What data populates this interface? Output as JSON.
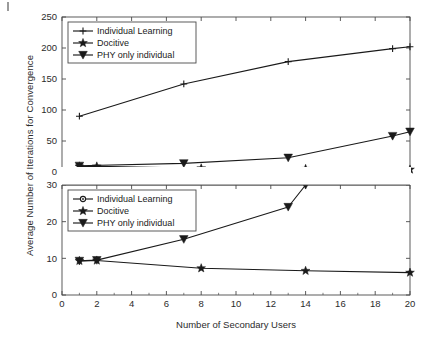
{
  "figure": {
    "background_color": "#ffffff",
    "line_color": "#1a1a1a",
    "axis_color": "#4a4a4a",
    "artifact_name": "scan-mark"
  },
  "axis_labels": {
    "xlabel": "Number of Secondary Users",
    "ylabel": "Average Number of Iterations for Convergence"
  },
  "chart_data": [
    {
      "type": "line",
      "id": "top-panel",
      "title": "",
      "xlabel": "",
      "ylabel": "Average Number of Iterations for Convergence",
      "xlim": [
        0,
        20
      ],
      "ylim": [
        0,
        250
      ],
      "xticks": [
        0,
        2,
        4,
        6,
        8,
        10,
        12,
        14,
        16,
        18,
        20
      ],
      "yticks": [
        0,
        50,
        100,
        150,
        200,
        250
      ],
      "xticklabels": [
        "0",
        "2",
        "4",
        "6",
        "8",
        "10",
        "12",
        "14",
        "16",
        "18",
        "20"
      ],
      "yticklabels": [
        "0",
        "50",
        "100",
        "150",
        "200",
        "250"
      ],
      "grid": false,
      "legend_position": "upper left",
      "series": [
        {
          "name": "Individual Learning",
          "marker": "plus",
          "x": [
            1,
            7,
            13,
            19,
            20
          ],
          "values": [
            90,
            142,
            178,
            199,
            202
          ]
        },
        {
          "name": "Docitive",
          "marker": "star",
          "x": [
            1,
            2,
            8,
            14,
            20
          ],
          "values": [
            9,
            9,
            6,
            5,
            4
          ]
        },
        {
          "name": "PHY only individual",
          "marker": "triangle-down",
          "x": [
            1,
            7,
            13,
            19,
            20
          ],
          "values": [
            10,
            14,
            23,
            58,
            65
          ]
        }
      ]
    },
    {
      "type": "line",
      "id": "bottom-panel",
      "title": "",
      "xlabel": "Number of Secondary Users",
      "ylabel": "",
      "xlim": [
        0,
        20
      ],
      "ylim": [
        0,
        30
      ],
      "xticks": [
        0,
        2,
        4,
        6,
        8,
        10,
        12,
        14,
        16,
        18,
        20
      ],
      "yticks": [
        0,
        10,
        20,
        30
      ],
      "xticklabels": [
        "0",
        "2",
        "4",
        "6",
        "8",
        "10",
        "12",
        "14",
        "16",
        "18",
        "20"
      ],
      "yticklabels": [
        "0",
        "10",
        "20",
        "30"
      ],
      "grid": false,
      "legend_position": "upper left",
      "series": [
        {
          "name": "Individual Learning",
          "marker": "circle",
          "x": [],
          "values": []
        },
        {
          "name": "Docitive",
          "marker": "star",
          "x": [
            1,
            2,
            8,
            14,
            20
          ],
          "values": [
            9.3,
            9.4,
            7.3,
            6.6,
            6.1
          ]
        },
        {
          "name": "PHY only individual",
          "marker": "triangle-down",
          "x": [
            1,
            2,
            7,
            13,
            14
          ],
          "values": [
            9.3,
            9.5,
            15.2,
            24.0,
            30.0
          ]
        }
      ]
    }
  ]
}
